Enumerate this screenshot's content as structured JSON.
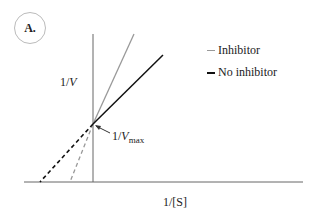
{
  "figure": {
    "panel_label": "A.",
    "y_axis_label": {
      "prefix": "1/",
      "var": "V"
    },
    "x_axis_label": "1/[S]",
    "intercept_label": {
      "prefix": "1/",
      "var": "V",
      "sub": "max"
    },
    "legend": [
      {
        "label": "Inhibitor",
        "color": "#999999"
      },
      {
        "label": "No inhibitor",
        "color": "#111111"
      }
    ],
    "colors": {
      "inhibitor": "#999999",
      "no_inhibitor": "#111111",
      "axis": "#555555"
    }
  }
}
